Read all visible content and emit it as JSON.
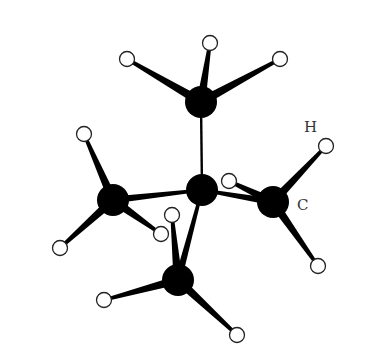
{
  "diagram": {
    "labels": {
      "hydrogen": "H",
      "carbon": "C"
    },
    "colors": {
      "carbon": "#000000",
      "hydrogen_fill": "#ffffff",
      "hydrogen_stroke": "#222222",
      "bond": "#000000"
    },
    "carbons": [
      {
        "id": "c-top",
        "x": 201,
        "y": 102,
        "r": 16
      },
      {
        "id": "c-center",
        "x": 202,
        "y": 190,
        "r": 16
      },
      {
        "id": "c-left",
        "x": 113,
        "y": 200,
        "r": 16
      },
      {
        "id": "c-right",
        "x": 273,
        "y": 202,
        "r": 16
      },
      {
        "id": "c-bottom",
        "x": 178,
        "y": 280,
        "r": 16
      }
    ],
    "hydrogens": [
      {
        "id": "h-top-1",
        "x": 127,
        "y": 59,
        "c": "c-top"
      },
      {
        "id": "h-top-2",
        "x": 210,
        "y": 43,
        "c": "c-top"
      },
      {
        "id": "h-top-3",
        "x": 280,
        "y": 59,
        "c": "c-top"
      },
      {
        "id": "h-left-1",
        "x": 84,
        "y": 134,
        "c": "c-left"
      },
      {
        "id": "h-left-2",
        "x": 60,
        "y": 248,
        "c": "c-left"
      },
      {
        "id": "h-left-3",
        "x": 161,
        "y": 234,
        "c": "c-left"
      },
      {
        "id": "h-right-1",
        "x": 326,
        "y": 146,
        "c": "c-right"
      },
      {
        "id": "h-right-2",
        "x": 229,
        "y": 181,
        "c": "c-right"
      },
      {
        "id": "h-right-3",
        "x": 318,
        "y": 266,
        "c": "c-right"
      },
      {
        "id": "h-bottom-1",
        "x": 172,
        "y": 215,
        "c": "c-bottom"
      },
      {
        "id": "h-bottom-2",
        "x": 104,
        "y": 300,
        "c": "c-bottom"
      },
      {
        "id": "h-bottom-3",
        "x": 237,
        "y": 335,
        "c": "c-bottom"
      }
    ],
    "cc_bonds": [
      [
        "c-center",
        "c-top"
      ],
      [
        "c-center",
        "c-left"
      ],
      [
        "c-center",
        "c-right"
      ],
      [
        "c-center",
        "c-bottom"
      ]
    ],
    "label_positions": {
      "hydrogen": {
        "x": 304,
        "y": 132
      },
      "carbon": {
        "x": 297,
        "y": 210
      }
    }
  }
}
